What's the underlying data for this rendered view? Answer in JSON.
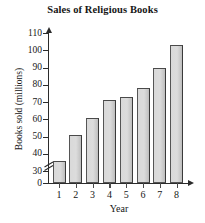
{
  "chart_data": {
    "type": "bar",
    "title": "Sales of Religious Books",
    "xlabel": "Year",
    "ylabel": "Books sold (millions)",
    "categories": [
      "1",
      "2",
      "3",
      "4",
      "5",
      "6",
      "7",
      "8"
    ],
    "values": [
      36,
      51,
      61,
      71,
      73,
      78,
      90,
      103
    ],
    "ytick_labels": [
      "0",
      "30",
      "40",
      "50",
      "60",
      "70",
      "80",
      "90",
      "100",
      "110"
    ],
    "ytick_values": [
      0,
      30,
      40,
      50,
      60,
      70,
      80,
      90,
      100,
      110
    ],
    "ylim": [
      30,
      110
    ],
    "axis_break": true,
    "axis_break_between": [
      0,
      30
    ],
    "grid": false,
    "legend": null,
    "bar_color": "#d9d9d9",
    "bar_edge_color": "#555555",
    "axis_color": "#2b2b2b",
    "background": "#ffffff"
  }
}
